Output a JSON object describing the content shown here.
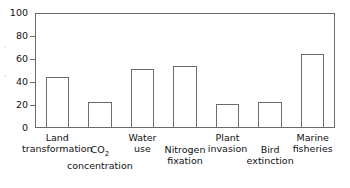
{
  "chart_data": {
    "type": "bar",
    "title": "",
    "xlabel": "",
    "ylabel": "",
    "ylim": [
      0,
      100
    ],
    "yticks": [
      0,
      20,
      40,
      60,
      80,
      100
    ],
    "grid": false,
    "legend": "none",
    "categories": [
      "Land transformation",
      "CO2 concentration",
      "Water use",
      "Nitrogen fixation",
      "Plant invasion",
      "Bird extinction",
      "Marine fisheries"
    ],
    "values": [
      44,
      22,
      51,
      54,
      20,
      22,
      65
    ],
    "bar_style": {
      "fill": "#ffffff",
      "edge": "#6b6b6b"
    }
  },
  "axis": {
    "y_tick_labels": [
      "0",
      "20",
      "40",
      "60",
      "80",
      "100"
    ]
  },
  "x_axis_labels": [
    {
      "line1": "Land",
      "line2": "transformation",
      "row": 0
    },
    {
      "line1": "CO",
      "sub": "2",
      "line2": "concentration",
      "row": 1
    },
    {
      "line1": "Water",
      "line2": "use",
      "row": 0
    },
    {
      "line1": "Nitrogen",
      "line2": "fixation",
      "row": 1
    },
    {
      "line1": "Plant",
      "line2": "invasion",
      "row": 0
    },
    {
      "line1": "Bird",
      "line2": "extinction",
      "row": 1
    },
    {
      "line1": "Marine",
      "line2": "fisheries",
      "row": 0
    }
  ],
  "edge_artifacts": [
    "‘",
    "‘"
  ]
}
